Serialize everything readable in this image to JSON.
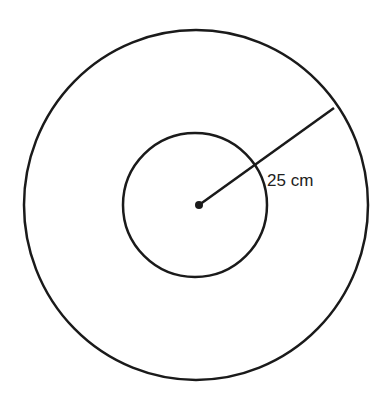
{
  "diagram": {
    "type": "concentric-circles",
    "outer_circle": {
      "cx": 196,
      "cy": 205,
      "rx": 172,
      "ry": 175
    },
    "inner_circle": {
      "cx": 195,
      "cy": 205,
      "r": 72
    },
    "center_point": {
      "x": 199,
      "y": 205
    },
    "radius_line": {
      "x1": 199,
      "y1": 205,
      "x2": 334,
      "y2": 108
    },
    "label": "25 cm",
    "stroke_color": "#1a1a1a"
  }
}
